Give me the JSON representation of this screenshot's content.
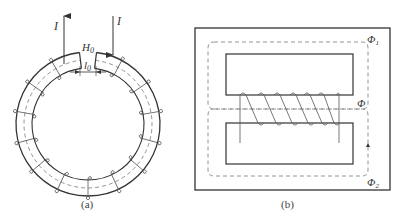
{
  "figure_a": {
    "caption": "(a)",
    "current_label_left": "I",
    "current_label_right": "I",
    "gap_field_label": "H",
    "gap_field_sub": "0",
    "gap_length_label": "l",
    "gap_length_sub": "0",
    "description": "Toroidal iron core with small air gap, uniformly wound coil"
  },
  "figure_b": {
    "caption": "(b)",
    "flux_total": "Φ",
    "flux_1_label": "Φ",
    "flux_1_sub": "1",
    "flux_2_label": "Φ",
    "flux_2_sub": "2",
    "description": "Three-limb (shell-type) core with coil on center limb; flux splits into two outer paths"
  },
  "colors": {
    "stroke": "#333333",
    "dashed": "#777777",
    "background": "#ffffff"
  }
}
